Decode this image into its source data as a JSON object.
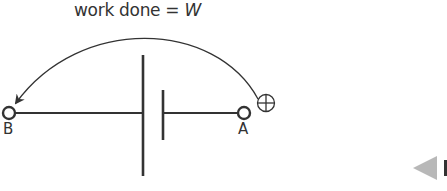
{
  "diagram": {
    "title_prefix": "work done = ",
    "title_var": "W",
    "terminals": [
      {
        "id": "B",
        "label": "B"
      },
      {
        "id": "A",
        "label": "A"
      }
    ],
    "charge_symbol": "positive-charge",
    "component": "cell",
    "arrow": {
      "from": "A",
      "to": "B",
      "meaning": "work done"
    }
  },
  "nav": {
    "prev_icon": "triangle-left-icon"
  },
  "colors": {
    "line": "#333333",
    "nav_triangle": "#b8b8b8"
  }
}
